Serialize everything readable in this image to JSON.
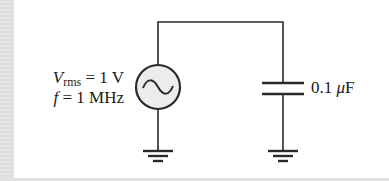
{
  "diagram": {
    "type": "circuit",
    "source": {
      "symbol": "ac-source-icon",
      "vrms_symbol": "V",
      "vrms_subscript": "rms",
      "vrms_value": "= 1 V",
      "freq_symbol": "f",
      "freq_value": "= 1 MHz"
    },
    "capacitor": {
      "value": "0.1 ",
      "unit_prefix": "μ",
      "unit": "F"
    },
    "grounds": 2
  },
  "colors": {
    "wire": "#2a2a2a",
    "source_fill": "#ececec",
    "background": "#ffffff",
    "margin": "#e4e4e4"
  }
}
